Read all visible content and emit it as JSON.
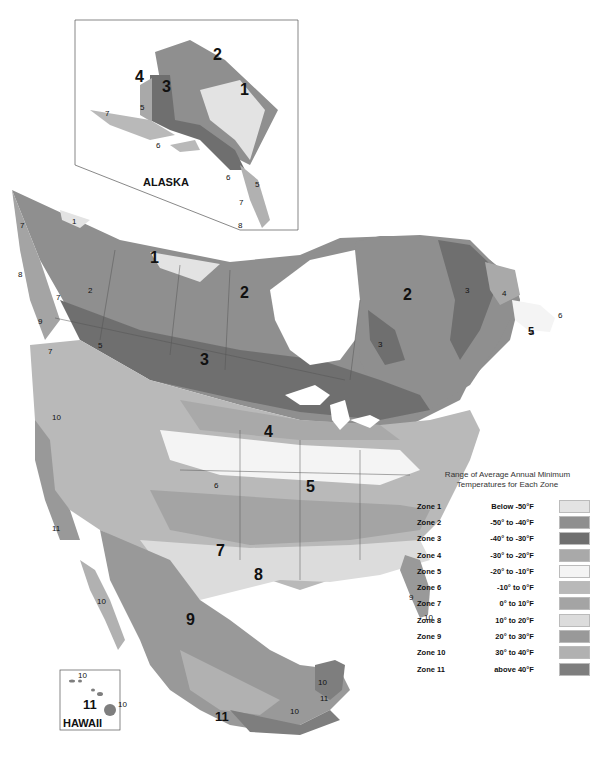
{
  "map": {
    "title": "Plant Hardiness Zones of North America",
    "insets": {
      "alaska": {
        "label": "ALASKA"
      },
      "hawaii": {
        "label": "HAWAII"
      }
    },
    "labels": {
      "ak_1": "1",
      "ak_2": "2",
      "ak_3": "3",
      "ak_4": "4",
      "ak_5": "5",
      "ak_6a": "6",
      "ak_6b": "6",
      "ak_7a": "7",
      "ak_7b": "7",
      "ak_5b": "5",
      "ak_8": "8",
      "yk_1": "1",
      "nw_1": "1",
      "nw_2": "2",
      "qc_2": "2",
      "pr_3": "3",
      "on_3": "3",
      "bc_2": "2",
      "bc_7a": "7",
      "bc_7b": "7",
      "bc_7c": "7",
      "bc_8": "8",
      "bc_9": "9",
      "bc_5": "5",
      "us_4": "4",
      "us_5": "5",
      "us_6": "6",
      "us_7": "7",
      "us_8": "8",
      "us_9": "9",
      "mx_9": "9",
      "mx_10": "10",
      "mx_11": "11",
      "fl_9": "9",
      "fl_10": "10",
      "ca_10": "10",
      "ca_11": "11",
      "lb_3": "3",
      "lb_4": "4",
      "nf_5": "5",
      "nf_4": "4",
      "nf_6": "6",
      "hi_11": "11",
      "hi_10a": "10",
      "hi_10b": "10",
      "yuc_10": "10",
      "yuc_11": "11",
      "yuc_10b": "10"
    }
  },
  "legend": {
    "title_line1": "Range of Average Annual Minimum",
    "title_line2": "Temperatures for Each Zone",
    "zones": [
      {
        "zone": "Zone 1",
        "range": "Below -50°F",
        "color": "#e3e3e3"
      },
      {
        "zone": "Zone 2",
        "range": "-50° to -40°F",
        "color": "#8f8f8f"
      },
      {
        "zone": "Zone 3",
        "range": "-40° to -30°F",
        "color": "#6f6f6f"
      },
      {
        "zone": "Zone 4",
        "range": "-30° to -20°F",
        "color": "#a9a9a9"
      },
      {
        "zone": "Zone 5",
        "range": "-20° to -10°F",
        "color": "#f4f4f4"
      },
      {
        "zone": "Zone 6",
        "range": "-10° to 0°F",
        "color": "#b9b9b9"
      },
      {
        "zone": "Zone 7",
        "range": "0° to 10°F",
        "color": "#a4a4a4"
      },
      {
        "zone": "Zone 8",
        "range": "10° to 20°F",
        "color": "#dcdcdc"
      },
      {
        "zone": "Zone 9",
        "range": "20° to 30°F",
        "color": "#999999"
      },
      {
        "zone": "Zone 10",
        "range": "30° to 40°F",
        "color": "#b1b1b1"
      },
      {
        "zone": "Zone 11",
        "range": "above 40°F",
        "color": "#7e7e7e"
      }
    ]
  }
}
